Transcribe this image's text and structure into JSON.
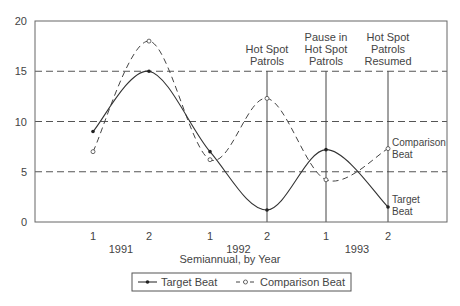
{
  "chart_data": {
    "type": "line",
    "title": "",
    "xlabel": "Semiannual, by Year",
    "ylabel": "",
    "ylim": [
      0,
      20
    ],
    "yticks": [
      0,
      5,
      10,
      15,
      20
    ],
    "grid": "dashed horizontal at 5, 10, 15",
    "categories": [
      "1991-1",
      "1991-2",
      "1992-1",
      "1992-2",
      "1993-1",
      "1993-2"
    ],
    "x_tick_labels": [
      "1",
      "2",
      "1",
      "2",
      "1",
      "2"
    ],
    "year_labels": [
      "1991",
      "1992",
      "1993"
    ],
    "series": [
      {
        "name": "Target Beat",
        "style": "solid, filled dot markers",
        "values": [
          9,
          15,
          7,
          1.2,
          7.2,
          1.5
        ]
      },
      {
        "name": "Comparison Beat",
        "style": "dashed, open circle markers",
        "values": [
          7,
          18,
          6.2,
          12.3,
          4.2,
          7.3
        ]
      }
    ],
    "annotations": [
      {
        "at": "1992-2",
        "text": [
          "Hot Spot",
          "Patrols"
        ]
      },
      {
        "at": "1993-1",
        "text": [
          "Pause in",
          "Hot Spot",
          "Patrols"
        ]
      },
      {
        "at": "1993-2",
        "text": [
          "Hot Spot",
          "Patrols",
          "Resumed"
        ]
      }
    ],
    "end_labels": {
      "comparison": [
        "Comparison",
        "Beat"
      ],
      "target": [
        "Target",
        "Beat"
      ]
    },
    "legend": {
      "position": "bottom-center",
      "entries": [
        "Target Beat",
        "Comparison Beat"
      ]
    }
  }
}
